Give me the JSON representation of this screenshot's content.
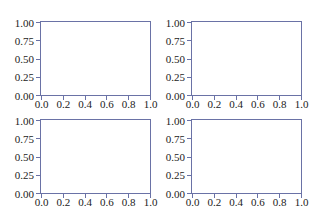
{
  "chart_data": [
    {
      "type": "line",
      "position": "top-left",
      "title": "",
      "xlabel": "",
      "ylabel": "",
      "xlim": [
        0.0,
        1.0
      ],
      "ylim": [
        0.0,
        1.0
      ],
      "x_ticks": [
        "0.0",
        "0.2",
        "0.4",
        "0.6",
        "0.8",
        "1.0"
      ],
      "y_ticks": [
        "0.00",
        "0.25",
        "0.50",
        "0.75",
        "1.00"
      ],
      "series": [],
      "grid": false,
      "legend": null
    },
    {
      "type": "line",
      "position": "top-right",
      "title": "",
      "xlabel": "",
      "ylabel": "",
      "xlim": [
        0.0,
        1.0
      ],
      "ylim": [
        0.0,
        1.0
      ],
      "x_ticks": [
        "0.0",
        "0.2",
        "0.4",
        "0.6",
        "0.8",
        "1.0"
      ],
      "y_ticks": [
        "0.00",
        "0.25",
        "0.50",
        "0.75",
        "1.00"
      ],
      "series": [],
      "grid": false,
      "legend": null
    },
    {
      "type": "line",
      "position": "bottom-left",
      "title": "",
      "xlabel": "",
      "ylabel": "",
      "xlim": [
        0.0,
        1.0
      ],
      "ylim": [
        0.0,
        1.0
      ],
      "x_ticks": [
        "0.0",
        "0.2",
        "0.4",
        "0.6",
        "0.8",
        "1.0"
      ],
      "y_ticks": [
        "0.00",
        "0.25",
        "0.50",
        "0.75",
        "1.00"
      ],
      "series": [],
      "grid": false,
      "legend": null
    },
    {
      "type": "line",
      "position": "bottom-right",
      "title": "",
      "xlabel": "",
      "ylabel": "",
      "xlim": [
        0.0,
        1.0
      ],
      "ylim": [
        0.0,
        1.0
      ],
      "x_ticks": [
        "0.0",
        "0.2",
        "0.4",
        "0.6",
        "0.8",
        "1.0"
      ],
      "y_ticks": [
        "0.00",
        "0.25",
        "0.50",
        "0.75",
        "1.00"
      ],
      "series": [],
      "grid": false,
      "legend": null
    }
  ],
  "colors": {
    "spine": "#6a72a6",
    "text": "#222222",
    "background": "#ffffff"
  }
}
